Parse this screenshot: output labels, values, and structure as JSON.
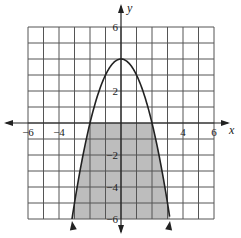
{
  "chart_data": {
    "type": "line",
    "title": "",
    "xlabel": "x",
    "ylabel": "y",
    "xlim": [
      -6,
      6
    ],
    "ylim": [
      -6,
      6
    ],
    "grid": true,
    "grid_step": 1,
    "x_tick_labels": [
      {
        "value": -6,
        "label": "−6"
      },
      {
        "value": -4,
        "label": "−4"
      },
      {
        "value": 4,
        "label": "4"
      },
      {
        "value": 6,
        "label": "6"
      }
    ],
    "y_tick_labels": [
      {
        "value": 6,
        "label": "6"
      },
      {
        "value": 2,
        "label": "2"
      },
      {
        "value": -2,
        "label": "−2"
      },
      {
        "value": -4,
        "label": "−4"
      },
      {
        "value": -6,
        "label": "−6"
      }
    ],
    "series": [
      {
        "name": "y = -x^2 + 4",
        "kind": "parabola",
        "vertex": [
          0,
          4
        ],
        "x_intercepts": [
          -2,
          2
        ],
        "x": [
          -3.16,
          -3,
          -2.5,
          -2,
          -1.5,
          -1,
          -0.5,
          0,
          0.5,
          1,
          1.5,
          2,
          2.5,
          3,
          3.16
        ],
        "y": [
          -6,
          -5,
          -2.25,
          0,
          1.75,
          3,
          3.75,
          4,
          3.75,
          3,
          1.75,
          0,
          -2.25,
          -5,
          -6
        ],
        "arrows_at_ends": true
      }
    ],
    "shaded_region": {
      "description": "Region inside the parabola below the x-axis",
      "bounds": "y <= -x^2 + 4 and y <= 0, down to y = -6",
      "color": "#bdbdbd"
    },
    "legend": null
  },
  "colors": {
    "background": "#ffffff",
    "grid": "#555555",
    "curve": "#222222",
    "shade": "#bdbdbd"
  }
}
